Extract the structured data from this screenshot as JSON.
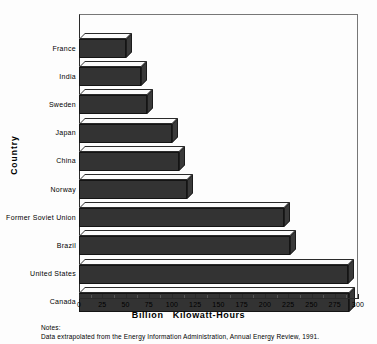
{
  "chart_data": {
    "type": "bar",
    "orientation": "horizontal",
    "title": "",
    "xlabel": "Billion   Kilowatt-Hours",
    "ylabel": "Country",
    "categories": [
      "France",
      "India",
      "Sweden",
      "Japan",
      "China",
      "Norway",
      "Former Soviet Union",
      "Brazil",
      "United States",
      "Canada"
    ],
    "values": [
      50,
      67,
      73,
      100,
      108,
      116,
      220,
      227,
      289,
      290
    ],
    "xlim": [
      0,
      300
    ],
    "xticks": [
      0,
      25,
      50,
      75,
      100,
      125,
      150,
      175,
      200,
      225,
      250,
      275,
      300
    ],
    "xtick_labels": [
      "0",
      "25",
      "50",
      "75",
      "100",
      "125",
      "150",
      "175",
      "200",
      "225",
      "250",
      "275",
      "300"
    ],
    "grid": false,
    "legend": null,
    "style_3d": true,
    "bar_color": "#333333",
    "bar_top_color": "#fbfbfb",
    "bar_outline_color": "#141414"
  },
  "notes": {
    "label": "Notes:",
    "text": "Data extrapolated from the Energy Information Administration, Annual Energy Review, 1991."
  }
}
